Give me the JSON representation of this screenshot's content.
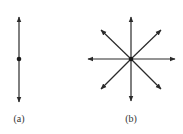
{
  "figure": {
    "panels": [
      {
        "id": "a",
        "label": "(a)",
        "description": "single vertical line with arrows at both ends and a central dot",
        "center": [
          19,
          59
        ],
        "arrows": [
          {
            "direction": "up",
            "end": [
              19,
              17
            ]
          },
          {
            "direction": "down",
            "end": [
              19,
              102
            ]
          }
        ]
      },
      {
        "id": "b",
        "label": "(b)",
        "description": "eight arrows radiating from a central dot",
        "center": [
          131,
          59
        ],
        "arrows": [
          {
            "direction": "up",
            "end": [
              131,
              17
            ]
          },
          {
            "direction": "down",
            "end": [
              131,
              101
            ]
          },
          {
            "direction": "left",
            "end": [
              88,
              59
            ]
          },
          {
            "direction": "right",
            "end": [
              175,
              59
            ]
          },
          {
            "direction": "up-left",
            "end": [
              101,
              30
            ]
          },
          {
            "direction": "up-right",
            "end": [
              161,
              30
            ]
          },
          {
            "direction": "down-left",
            "end": [
              101,
              89
            ]
          },
          {
            "direction": "down-right",
            "end": [
              161,
              89
            ]
          }
        ]
      }
    ],
    "colors": {
      "stroke": "#2a2a2a",
      "background": "#ffffff"
    }
  }
}
